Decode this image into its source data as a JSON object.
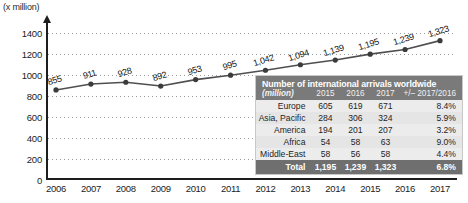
{
  "axis_unit_label": "(x million)",
  "chart_data": {
    "type": "line",
    "title": "",
    "xlabel": "",
    "ylabel": "(x million)",
    "ylim": [
      0,
      1500
    ],
    "yticks": [
      0,
      200,
      400,
      600,
      800,
      1000,
      1200,
      1400
    ],
    "grid": true,
    "legend": "none",
    "categories": [
      "2006",
      "2007",
      "2008",
      "2009",
      "2010",
      "2011",
      "2012",
      "2013",
      "2014",
      "2015",
      "2016",
      "2017"
    ],
    "values": [
      855,
      911,
      928,
      892,
      953,
      995,
      1042,
      1094,
      1139,
      1195,
      1239,
      1323
    ],
    "point_labels": [
      "855",
      "911",
      "928",
      "892",
      "953",
      "995",
      "1,042",
      "1,094",
      "1,139",
      "1,195",
      "1,239",
      "1,323"
    ],
    "series_color": "#4f4f4f",
    "marker_color": "#3b3b3b"
  },
  "table": {
    "title": "Number of international arrivals worldwide",
    "unit": "(million)",
    "columns": [
      "2015",
      "2016",
      "2017",
      "+/– 2017/2016"
    ],
    "rows": [
      {
        "region": "Europe",
        "y2015": "605",
        "y2016": "619",
        "y2017": "671",
        "delta": "8.4%"
      },
      {
        "region": "Asia, Pacific",
        "y2015": "284",
        "y2016": "306",
        "y2017": "324",
        "delta": "5.9%"
      },
      {
        "region": "America",
        "y2015": "194",
        "y2016": "201",
        "y2017": "207",
        "delta": "3.2%"
      },
      {
        "region": "Africa",
        "y2015": "54",
        "y2016": "58",
        "y2017": "63",
        "delta": "9.0%"
      },
      {
        "region": "Middle-East",
        "y2015": "58",
        "y2016": "56",
        "y2017": "58",
        "delta": "4.4%"
      }
    ],
    "total": {
      "region": "Total",
      "y2015": "1,195",
      "y2016": "1,239",
      "y2017": "1,323",
      "delta": "6.8%"
    },
    "header_bg": "#7a7a7a",
    "total_bg": "#6f6f6f",
    "body_bg": "#e9e9e9"
  }
}
